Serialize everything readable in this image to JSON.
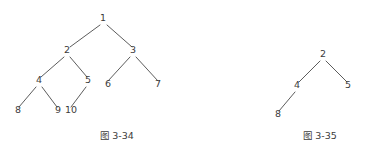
{
  "page": {
    "background_color": "#ffffff",
    "ink_color": "#3c3c3c",
    "line_color": "#4a4a4a"
  },
  "chart_data": {
    "type": "diagram",
    "diagram_kind": "tree",
    "title": "",
    "figures": [
      {
        "id": "fig-3-34",
        "caption_prefix": "图",
        "caption_number": "3-34",
        "caption_full": "图 3-34",
        "caption_x": 117,
        "caption_y": 131,
        "nodes": [
          {
            "label": "1",
            "x": 103,
            "y": 22
          },
          {
            "label": "2",
            "x": 67,
            "y": 54
          },
          {
            "label": "3",
            "x": 133,
            "y": 54
          },
          {
            "label": "4",
            "x": 39,
            "y": 84
          },
          {
            "label": "5",
            "x": 88,
            "y": 84
          },
          {
            "label": "6",
            "x": 108,
            "y": 88
          },
          {
            "label": "7",
            "x": 158,
            "y": 88
          },
          {
            "label": "8",
            "x": 18,
            "y": 114
          },
          {
            "label": "9",
            "x": 58,
            "y": 114
          },
          {
            "label": "10",
            "x": 71,
            "y": 114
          }
        ],
        "edges": [
          {
            "from": "1",
            "to": "2",
            "x1": 100,
            "y1": 25,
            "x2": 70,
            "y2": 47
          },
          {
            "from": "1",
            "to": "3",
            "x1": 107,
            "y1": 25,
            "x2": 132,
            "y2": 47
          },
          {
            "from": "2",
            "to": "4",
            "x1": 64,
            "y1": 57,
            "x2": 41,
            "y2": 77
          },
          {
            "from": "2",
            "to": "5",
            "x1": 70,
            "y1": 57,
            "x2": 87,
            "y2": 77
          },
          {
            "from": "3",
            "to": "6",
            "x1": 130,
            "y1": 57,
            "x2": 108,
            "y2": 81
          },
          {
            "from": "3",
            "to": "7",
            "x1": 136,
            "y1": 57,
            "x2": 158,
            "y2": 81
          },
          {
            "from": "4",
            "to": "8",
            "x1": 36,
            "y1": 87,
            "x2": 19,
            "y2": 107
          },
          {
            "from": "4",
            "to": "9",
            "x1": 42,
            "y1": 87,
            "x2": 57,
            "y2": 107
          },
          {
            "from": "5",
            "to": "10",
            "x1": 86,
            "y1": 87,
            "x2": 71,
            "y2": 107
          }
        ]
      },
      {
        "id": "fig-3-35",
        "caption_prefix": "图",
        "caption_number": "3-35",
        "caption_full": "图 3-35",
        "caption_x": 320,
        "caption_y": 131,
        "nodes": [
          {
            "label": "2",
            "x": 323,
            "y": 58
          },
          {
            "label": "4",
            "x": 297,
            "y": 89
          },
          {
            "label": "5",
            "x": 348,
            "y": 89
          },
          {
            "label": "8",
            "x": 278,
            "y": 118
          }
        ],
        "edges": [
          {
            "from": "2",
            "to": "4",
            "x1": 320,
            "y1": 61,
            "x2": 299,
            "y2": 82
          },
          {
            "from": "2",
            "to": "5",
            "x1": 326,
            "y1": 61,
            "x2": 347,
            "y2": 82
          },
          {
            "from": "4",
            "to": "8",
            "x1": 295,
            "y1": 92,
            "x2": 279,
            "y2": 111
          }
        ]
      }
    ]
  },
  "figures_text": {
    "fig34_caption": "图 3-34",
    "fig35_caption": "图 3-35"
  }
}
